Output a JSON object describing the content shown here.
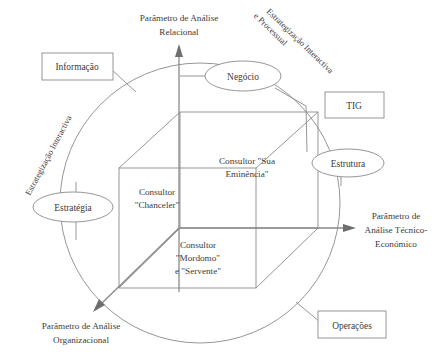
{
  "diagram": {
    "axes": [
      {
        "id": "vertical",
        "name": "axis-relational",
        "lines": [
          "Parâmetro de Análise",
          "Relacional"
        ]
      },
      {
        "id": "horizontal",
        "name": "axis-tecnico-economico",
        "lines": [
          "Parâmetro de",
          "Análise Técnico-",
          "Económico"
        ]
      },
      {
        "id": "diagonal",
        "name": "axis-organizacional",
        "lines": [
          "Parâmetro de Análise",
          "Organizacional"
        ]
      }
    ],
    "rotated_labels": [
      {
        "id": "left",
        "name": "label-estrategizacao-interactiva",
        "lines": [
          "Estrategização Interactiva"
        ]
      },
      {
        "id": "right",
        "name": "label-estrategizacao-interactiva-processual",
        "lines": [
          "Estrategização Interactiva",
          "e Processual"
        ]
      }
    ],
    "ellipses": [
      {
        "id": "negocio",
        "label": "Negócio"
      },
      {
        "id": "estrutura",
        "label": "Estrutura"
      },
      {
        "id": "estrategia",
        "label": "Estratégia"
      }
    ],
    "boxes": [
      {
        "id": "informacao",
        "label": "Informação"
      },
      {
        "id": "tig",
        "label": "TIG"
      },
      {
        "id": "operacoes",
        "label": "Operações"
      }
    ],
    "cube_faces": [
      {
        "id": "top",
        "lines": [
          "Consultor \"Sua",
          "Eminência\""
        ]
      },
      {
        "id": "left",
        "lines": [
          "Consultor",
          "\"Chanceler\""
        ]
      },
      {
        "id": "front",
        "lines": [
          "Consultor",
          "\"Mordomo\"",
          "e \"Servente\""
        ]
      }
    ],
    "colors": {
      "stroke": "#8a8a8a",
      "text": "#3b3b3b",
      "background": "#ffffff"
    }
  }
}
